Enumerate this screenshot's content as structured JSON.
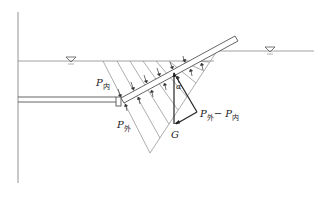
{
  "diagram": {
    "type": "hydrostatic pressure on inclined slab",
    "colors": {
      "line": "#555555",
      "thin_line": "#8a8a8a",
      "force": "#222222"
    },
    "labels": {
      "p_inner": {
        "main": "P",
        "sub": "内"
      },
      "p_outer": {
        "main": "P",
        "sub": "外"
      },
      "alpha": "α",
      "p_diff": {
        "main1": "P",
        "sub1": "外",
        "sep": "− ",
        "main2": "P",
        "sub2": "内"
      },
      "g": "G"
    },
    "icons": {
      "water_level_left": "water-level-triangle",
      "water_level_right": "water-level-triangle"
    }
  }
}
